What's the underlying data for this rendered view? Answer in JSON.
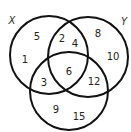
{
  "diagram": {
    "type": "venn-3",
    "stroke_color": "#111111",
    "sets": [
      {
        "id": "X",
        "label": "X",
        "cx": 49,
        "cy": 55,
        "r": 39,
        "label_x": 12,
        "label_y": 20
      },
      {
        "id": "Y",
        "label": "Y",
        "cx": 88,
        "cy": 57,
        "r": 40,
        "label_x": 124,
        "label_y": 21
      },
      {
        "id": "Z",
        "label": "",
        "cx": 69,
        "cy": 91,
        "r": 39
      }
    ],
    "regions": [
      {
        "region": "X only",
        "values": [
          {
            "text": "5",
            "x": 37,
            "y": 36
          },
          {
            "text": "1",
            "x": 25,
            "y": 59
          }
        ]
      },
      {
        "region": "X and Y only",
        "values": [
          {
            "text": "2",
            "x": 62,
            "y": 38
          },
          {
            "text": "4",
            "x": 75,
            "y": 43
          }
        ]
      },
      {
        "region": "Y only",
        "values": [
          {
            "text": "8",
            "x": 98,
            "y": 33
          },
          {
            "text": "10",
            "x": 113,
            "y": 56
          }
        ]
      },
      {
        "region": "X and Z only",
        "values": [
          {
            "text": "3",
            "x": 44,
            "y": 82
          }
        ]
      },
      {
        "region": "X, Y and Z",
        "values": [
          {
            "text": "6",
            "x": 69,
            "y": 71
          }
        ]
      },
      {
        "region": "Y and Z only",
        "values": [
          {
            "text": "12",
            "x": 94,
            "y": 81
          }
        ]
      },
      {
        "region": "Z only",
        "values": [
          {
            "text": "9",
            "x": 56,
            "y": 109
          },
          {
            "text": "15",
            "x": 79,
            "y": 116
          }
        ]
      }
    ]
  }
}
